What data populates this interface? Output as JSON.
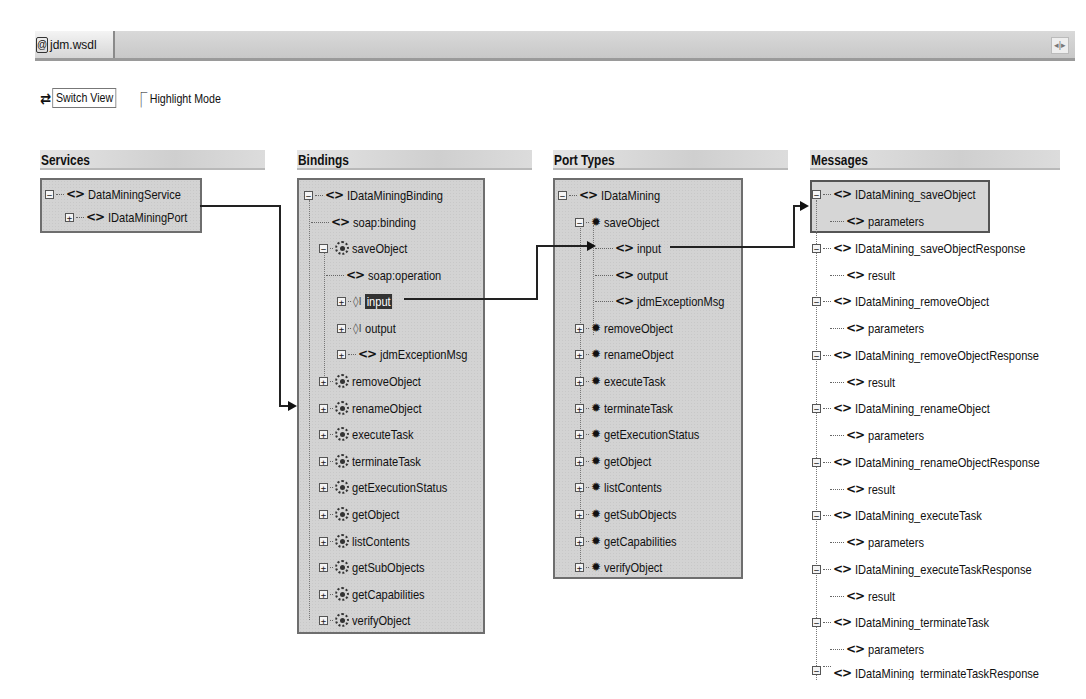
{
  "tabbar": {
    "tabs": [
      {
        "label": "jdm.wsdl",
        "icon": "wsdl-file-icon"
      }
    ],
    "nav_icon": "tab-scroll-arrows-icon"
  },
  "toolbar": {
    "switch_view": {
      "label": "Switch View",
      "icon": "switch-arrows-icon"
    },
    "highlight_mode": {
      "label": "Highlight Mode",
      "icon": "highlight-arrow-icon"
    }
  },
  "columns": {
    "services": {
      "header": "Services",
      "items": [
        {
          "label": "DataMiningService",
          "icon": "tag",
          "expander": "-",
          "level": 0
        },
        {
          "label": "IDataMiningPort",
          "icon": "tag",
          "expander": "+",
          "level": 1
        }
      ]
    },
    "bindings": {
      "header": "Bindings",
      "items": [
        {
          "label": "IDataMiningBinding",
          "icon": "tag",
          "expander": "-",
          "level": 0
        },
        {
          "label": "soap:binding",
          "icon": "tag",
          "expander": "",
          "level": 1
        },
        {
          "label": "saveObject",
          "icon": "operation",
          "expander": "-",
          "level": 1
        },
        {
          "label": "soap:operation",
          "icon": "tag",
          "expander": "",
          "level": 2
        },
        {
          "label": "input",
          "icon": "io",
          "expander": "+",
          "level": 2,
          "selected": true
        },
        {
          "label": "output",
          "icon": "io",
          "expander": "+",
          "level": 2
        },
        {
          "label": "jdmExceptionMsg",
          "icon": "tag",
          "expander": "+",
          "level": 2
        },
        {
          "label": "removeObject",
          "icon": "operation",
          "expander": "+",
          "level": 1
        },
        {
          "label": "renameObject",
          "icon": "operation",
          "expander": "+",
          "level": 1
        },
        {
          "label": "executeTask",
          "icon": "operation",
          "expander": "+",
          "level": 1
        },
        {
          "label": "terminateTask",
          "icon": "operation",
          "expander": "+",
          "level": 1
        },
        {
          "label": "getExecutionStatus",
          "icon": "operation",
          "expander": "+",
          "level": 1
        },
        {
          "label": "getObject",
          "icon": "operation",
          "expander": "+",
          "level": 1
        },
        {
          "label": "listContents",
          "icon": "operation",
          "expander": "+",
          "level": 1
        },
        {
          "label": "getSubObjects",
          "icon": "operation",
          "expander": "+",
          "level": 1
        },
        {
          "label": "getCapabilities",
          "icon": "operation",
          "expander": "+",
          "level": 1
        },
        {
          "label": "verifyObject",
          "icon": "operation",
          "expander": "+",
          "level": 1
        }
      ]
    },
    "port_types": {
      "header": "Port Types",
      "items": [
        {
          "label": "IDataMining",
          "icon": "tag",
          "expander": "-",
          "level": 0
        },
        {
          "label": "saveObject",
          "icon": "gear",
          "expander": "-",
          "level": 1
        },
        {
          "label": "input",
          "icon": "tag",
          "expander": "",
          "level": 2
        },
        {
          "label": "output",
          "icon": "tag",
          "expander": "",
          "level": 2
        },
        {
          "label": "jdmExceptionMsg",
          "icon": "tag",
          "expander": "",
          "level": 2
        },
        {
          "label": "removeObject",
          "icon": "gear",
          "expander": "+",
          "level": 1
        },
        {
          "label": "renameObject",
          "icon": "gear",
          "expander": "+",
          "level": 1
        },
        {
          "label": "executeTask",
          "icon": "gear",
          "expander": "+",
          "level": 1
        },
        {
          "label": "terminateTask",
          "icon": "gear",
          "expander": "+",
          "level": 1
        },
        {
          "label": "getExecutionStatus",
          "icon": "gear",
          "expander": "+",
          "level": 1
        },
        {
          "label": "getObject",
          "icon": "gear",
          "expander": "+",
          "level": 1
        },
        {
          "label": "listContents",
          "icon": "gear",
          "expander": "+",
          "level": 1
        },
        {
          "label": "getSubObjects",
          "icon": "gear",
          "expander": "+",
          "level": 1
        },
        {
          "label": "getCapabilities",
          "icon": "gear",
          "expander": "+",
          "level": 1
        },
        {
          "label": "verifyObject",
          "icon": "gear",
          "expander": "+",
          "level": 1
        }
      ]
    },
    "messages": {
      "header": "Messages",
      "items": [
        {
          "label": "IDataMining_saveObject",
          "child": "parameters",
          "highlighted": true
        },
        {
          "label": "IDataMining_saveObjectResponse",
          "child": "result"
        },
        {
          "label": "IDataMining_removeObject",
          "child": "parameters"
        },
        {
          "label": "IDataMining_removeObjectResponse",
          "child": "result"
        },
        {
          "label": "IDataMining_renameObject",
          "child": "parameters"
        },
        {
          "label": "IDataMining_renameObjectResponse",
          "child": "result"
        },
        {
          "label": "IDataMining_executeTask",
          "child": "parameters"
        },
        {
          "label": "IDataMining_executeTaskResponse",
          "child": "result"
        },
        {
          "label": "IDataMining_terminateTask",
          "child": "parameters"
        },
        {
          "label": "IDataMining_terminateTaskResponse",
          "child": ""
        }
      ]
    }
  },
  "colors": {
    "panel_bg": "#d3d3d3",
    "panel_border": "#6e6e6e",
    "selection_bg": "#333333",
    "connector": "#222222"
  }
}
